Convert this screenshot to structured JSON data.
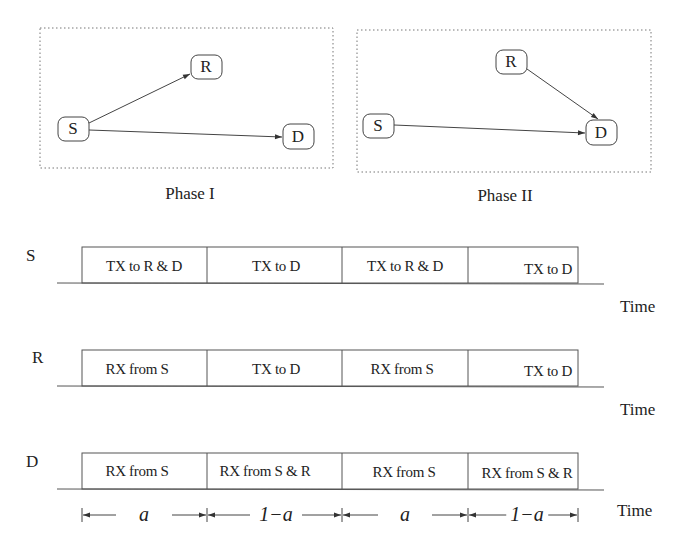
{
  "phases": [
    {
      "label": "Phase I",
      "nodes": {
        "S": "S",
        "R": "R",
        "D": "D"
      },
      "links": [
        [
          "S",
          "R"
        ],
        [
          "S",
          "D"
        ]
      ]
    },
    {
      "label": "Phase II",
      "nodes": {
        "S": "S",
        "R": "R",
        "D": "D"
      },
      "links": [
        [
          "R",
          "D"
        ],
        [
          "S",
          "D"
        ]
      ]
    }
  ],
  "timelines": [
    {
      "node": "S",
      "time_label": "Time",
      "slots": [
        "TX to R & D",
        "TX to D",
        "TX to R & D",
        "TX to D"
      ]
    },
    {
      "node": "R",
      "time_label": "Time",
      "slots": [
        "RX from S",
        "TX to D",
        "RX from S",
        "TX to D"
      ]
    },
    {
      "node": "D",
      "time_label": "Time",
      "slots": [
        "RX from S",
        "RX from S & R",
        "RX from S",
        "RX from S & R"
      ]
    }
  ],
  "durations": {
    "labels": [
      "a",
      "1−a",
      "a",
      "1−a"
    ],
    "time_label": "Time"
  }
}
